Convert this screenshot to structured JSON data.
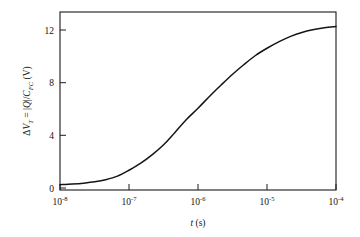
{
  "chart_data": {
    "type": "line",
    "title": "",
    "xlabel": "t (s)",
    "xlabel_parts": {
      "symbol": "t",
      "unit": "(s)"
    },
    "ylabel": "ΔV_T = |Q|/C_FC (V)",
    "ylabel_parts": {
      "delta": "Δ",
      "v": "V",
      "v_sub": "T",
      "equals": " = |",
      "q": "Q",
      "slash": "|/",
      "c": "C",
      "c_sub": "FC",
      "unit": " (V)"
    },
    "xscale": "log",
    "yscale": "linear",
    "xlim": [
      1e-08,
      0.0001
    ],
    "ylim": [
      0,
      13.5
    ],
    "grid": false,
    "legend": null,
    "xticks": [
      1e-08,
      1e-07,
      1e-06,
      1e-05,
      0.0001
    ],
    "xtick_labels": [
      {
        "base": "10",
        "exp": "-8"
      },
      {
        "base": "10",
        "exp": "-7"
      },
      {
        "base": "10",
        "exp": "-6"
      },
      {
        "base": "10",
        "exp": "-5"
      },
      {
        "base": "10",
        "exp": "-4"
      }
    ],
    "yticks": [
      0,
      4,
      8,
      12
    ],
    "ytick_labels": [
      "0",
      "4",
      "8",
      "12"
    ],
    "series": [
      {
        "name": "threshold-voltage-shift",
        "color": "#151515",
        "x": [
          1e-08,
          1.5e-08,
          2.2e-08,
          3.2e-08,
          4.6e-08,
          6.8e-08,
          1e-07,
          1.5e-07,
          2.2e-07,
          3.2e-07,
          4.6e-07,
          6.8e-07,
          1e-06,
          1.5e-06,
          2.2e-06,
          3.2e-06,
          4.6e-06,
          6.8e-06,
          1e-05,
          1.5e-05,
          2.2e-05,
          3.2e-05,
          4.6e-05,
          6.8e-05,
          0.0001
        ],
        "y": [
          0.4,
          0.45,
          0.52,
          0.62,
          0.78,
          1.05,
          1.5,
          2.05,
          2.7,
          3.45,
          4.35,
          5.35,
          6.2,
          7.15,
          8.0,
          8.8,
          9.5,
          10.2,
          10.75,
          11.25,
          11.65,
          11.95,
          12.15,
          12.3,
          12.4
        ]
      }
    ]
  },
  "plot_geometry": {
    "left": 60,
    "right": 336,
    "top": 12,
    "bottom": 190
  }
}
